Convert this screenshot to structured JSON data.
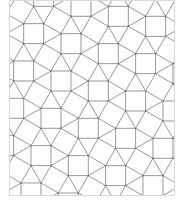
{
  "figure": {
    "type": "snub-square-tiling",
    "width": 190,
    "height": 215,
    "clip": {
      "x": 9,
      "y": 0,
      "width": 166,
      "height": 196
    },
    "edge_length": 20,
    "rotation_deg": 15,
    "origin": {
      "x": 20,
      "y": 10
    },
    "colors": {
      "background": "#ffffff",
      "line": "#8c8c8c",
      "border": "#d9d9d9",
      "vertex": "#666666"
    },
    "line_width": 0.9
  }
}
